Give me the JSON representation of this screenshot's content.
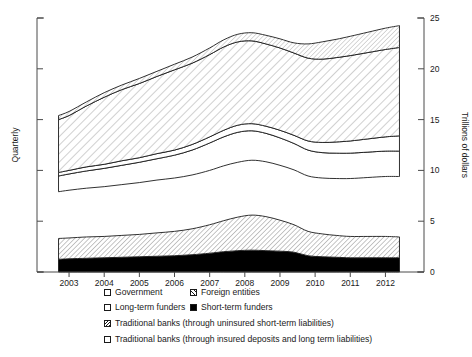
{
  "chart_data": {
    "type": "area",
    "title": "",
    "subtitle": "",
    "stacked": true,
    "xlabel": "",
    "ylabel": "Trillions of dollars",
    "left_axis_label": "Quarterly",
    "grid": false,
    "legend_position": "bottom",
    "xlim": [
      2002.6,
      2012.5
    ],
    "ylim": [
      0,
      25
    ],
    "y_ticks": [
      0,
      5,
      10,
      15,
      20,
      25
    ],
    "y_tick_labels": [
      "0",
      "5",
      "10",
      "15",
      "20",
      "25"
    ],
    "x_ticks": [
      2003,
      2004,
      2005,
      2006,
      2007,
      2008,
      2009,
      2010,
      2011,
      2012
    ],
    "x_tick_labels": [
      "2003",
      "2004",
      "2005",
      "2006",
      "2007",
      "2008",
      "2009",
      "2010",
      "2011",
      "2012"
    ],
    "left_axis_ticks_labeled": false,
    "x": [
      2002.7,
      2003.0,
      2003.5,
      2004.0,
      2004.5,
      2005.0,
      2005.5,
      2006.0,
      2006.5,
      2007.0,
      2007.4,
      2007.8,
      2008.2,
      2008.6,
      2009.0,
      2009.4,
      2009.8,
      2010.2,
      2010.6,
      2011.0,
      2011.5,
      2012.0,
      2012.4
    ],
    "series": [
      {
        "name": "Short-term funders",
        "pattern": "solid-black",
        "values": [
          1.25,
          1.3,
          1.35,
          1.4,
          1.45,
          1.5,
          1.55,
          1.6,
          1.7,
          1.85,
          2.0,
          2.1,
          2.15,
          2.1,
          2.05,
          1.95,
          1.6,
          1.5,
          1.45,
          1.4,
          1.4,
          1.4,
          1.4
        ]
      },
      {
        "name": "Traditional banks (through uninsured short-term liabilities)",
        "pattern": "hatch-dense",
        "values": [
          2.05,
          2.05,
          2.1,
          2.1,
          2.15,
          2.2,
          2.3,
          2.4,
          2.55,
          2.8,
          3.05,
          3.3,
          3.45,
          3.35,
          3.05,
          2.7,
          2.4,
          2.25,
          2.15,
          2.1,
          2.1,
          2.1,
          2.05
        ]
      },
      {
        "name": "gap",
        "pattern": "none",
        "values": [
          4.6,
          4.7,
          4.8,
          4.9,
          5.0,
          5.1,
          5.2,
          5.25,
          5.3,
          5.35,
          5.4,
          5.4,
          5.4,
          5.4,
          5.4,
          5.4,
          5.45,
          5.5,
          5.6,
          5.7,
          5.8,
          5.9,
          5.95
        ]
      },
      {
        "name": "Long-term funders",
        "pattern": "open",
        "values": [
          1.55,
          1.6,
          1.7,
          1.8,
          1.9,
          2.0,
          2.1,
          2.25,
          2.45,
          2.7,
          2.85,
          2.95,
          2.9,
          2.8,
          2.7,
          2.6,
          2.55,
          2.5,
          2.5,
          2.5,
          2.5,
          2.5,
          2.5
        ]
      },
      {
        "name": "Traditional banks (through insured deposits and long term liabilities)",
        "pattern": "open-thin",
        "values": [
          0.35,
          0.35,
          0.4,
          0.4,
          0.45,
          0.45,
          0.5,
          0.5,
          0.55,
          0.6,
          0.65,
          0.7,
          0.7,
          0.7,
          0.75,
          0.8,
          0.9,
          1.0,
          1.1,
          1.2,
          1.3,
          1.4,
          1.5
        ]
      },
      {
        "name": "Foreign entities",
        "pattern": "hatch-light",
        "values": [
          5.2,
          5.4,
          6.0,
          6.6,
          7.0,
          7.3,
          7.6,
          7.9,
          8.0,
          8.1,
          8.2,
          8.2,
          8.15,
          8.1,
          8.1,
          8.1,
          8.15,
          8.2,
          8.3,
          8.4,
          8.5,
          8.6,
          8.7
        ]
      },
      {
        "name": "Government",
        "pattern": "hatch-faint",
        "values": [
          0.4,
          0.4,
          0.4,
          0.45,
          0.45,
          0.5,
          0.5,
          0.55,
          0.6,
          0.65,
          0.7,
          0.75,
          0.8,
          0.85,
          0.9,
          1.0,
          1.4,
          1.7,
          1.8,
          1.9,
          2.0,
          2.1,
          2.15
        ]
      }
    ],
    "stack_tops_note": "Lower cluster tops at about 3.3-5.5; upper cluster spans about 8 to 25 trillions of dollars.",
    "annotations": []
  },
  "legend": {
    "rows": [
      [
        {
          "label": "Government",
          "pattern": "open"
        },
        {
          "label": "Foreign entities",
          "pattern": "hatch-a"
        }
      ],
      [
        {
          "label": "Long-term funders",
          "pattern": "open"
        },
        {
          "label": "Short-term funders",
          "pattern": "solid"
        }
      ],
      [
        {
          "label": "Traditional banks (through uninsured short-term liabilities)",
          "pattern": "hatch-b"
        }
      ],
      [
        {
          "label": "Traditional banks (through insured deposits and long term liabilities)",
          "pattern": "open"
        }
      ]
    ]
  }
}
